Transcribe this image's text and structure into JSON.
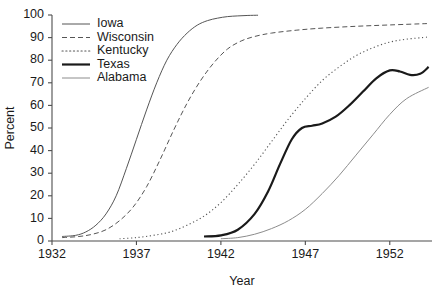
{
  "chart_data": {
    "type": "line",
    "title": "",
    "xlabel": "Year",
    "ylabel": "Percent",
    "xlim": [
      1932,
      1954.5
    ],
    "ylim": [
      0,
      100
    ],
    "grid": false,
    "legend_position": "top-left-inside",
    "xticks": [
      1932,
      1937,
      1942,
      1947,
      1952
    ],
    "xtick_labels": [
      "1932",
      "1937",
      "1942",
      "1947",
      "1952"
    ],
    "yticks": [
      0,
      10,
      20,
      30,
      40,
      50,
      60,
      70,
      80,
      90,
      100
    ],
    "ytick_labels": [
      "0",
      "10",
      "20",
      "30",
      "40",
      "50",
      "60",
      "70",
      "80",
      "90",
      "100"
    ],
    "series": [
      {
        "name": "Iowa",
        "style": "solid",
        "color": "#555555",
        "width": 1.0,
        "x": [
          1932.6,
          1933.4,
          1934.0,
          1934.6,
          1935.2,
          1935.8,
          1936.4,
          1937.0,
          1937.6,
          1938.2,
          1938.8,
          1939.4,
          1940.0,
          1940.6,
          1941.2,
          1941.8,
          1942.4,
          1943.0,
          1943.6,
          1944.2
        ],
        "y": [
          2,
          2.5,
          4,
          7,
          12,
          20,
          32,
          45,
          58,
          70,
          80,
          87,
          92,
          95.5,
          97.5,
          98.6,
          99.3,
          99.6,
          99.8,
          99.9
        ]
      },
      {
        "name": "Wisconsin",
        "style": "dashed",
        "color": "#555555",
        "width": 1.0,
        "x": [
          1932.6,
          1933.6,
          1934.4,
          1935.2,
          1936.0,
          1936.8,
          1937.6,
          1938.4,
          1939.2,
          1940.0,
          1940.8,
          1941.6,
          1942.4,
          1943.2,
          1944.0,
          1945.0,
          1946.5,
          1948.0,
          1950.0,
          1952.0,
          1954.2
        ],
        "y": [
          1.5,
          2,
          3,
          5,
          9,
          15,
          24,
          36,
          49,
          61,
          71,
          79,
          85,
          88.5,
          90.5,
          92,
          93.3,
          94.2,
          95.0,
          95.6,
          96.2
        ]
      },
      {
        "name": "Kentucky",
        "style": "dotted",
        "color": "#555555",
        "width": 1.1,
        "x": [
          1936.0,
          1937.0,
          1938.0,
          1939.0,
          1940.0,
          1941.0,
          1942.0,
          1943.0,
          1944.0,
          1945.0,
          1946.0,
          1947.0,
          1948.0,
          1949.0,
          1950.0,
          1951.0,
          1952.0,
          1953.0,
          1954.2
        ],
        "y": [
          1,
          1.5,
          2.5,
          4,
          7,
          11,
          17,
          25,
          34,
          44,
          54,
          63,
          71,
          77,
          82,
          85.5,
          88,
          89.3,
          90.2
        ]
      },
      {
        "name": "Texas",
        "style": "solid",
        "color": "#1a1a1a",
        "width": 2.2,
        "x": [
          1941.0,
          1942.0,
          1943.0,
          1944.0,
          1944.8,
          1945.5,
          1946.2,
          1946.8,
          1947.4,
          1948.0,
          1948.8,
          1949.6,
          1950.4,
          1951.2,
          1952.0,
          1952.6,
          1953.2,
          1953.8,
          1954.3
        ],
        "y": [
          2,
          2.5,
          5,
          12,
          22,
          34,
          45,
          50,
          51,
          52,
          55,
          60,
          66,
          72,
          75.5,
          75,
          73.5,
          74,
          77
        ]
      },
      {
        "name": "Alabama",
        "style": "solid",
        "color": "#8c8c8c",
        "width": 1.0,
        "x": [
          1942.0,
          1943.0,
          1944.0,
          1945.0,
          1946.0,
          1947.0,
          1948.0,
          1949.0,
          1950.0,
          1951.0,
          1952.0,
          1953.0,
          1954.3
        ],
        "y": [
          1,
          1.5,
          3,
          5.5,
          9,
          14,
          21,
          29,
          38,
          47,
          56,
          63,
          68
        ]
      }
    ]
  },
  "legend": {
    "items": [
      {
        "label": "Iowa"
      },
      {
        "label": "Wisconsin"
      },
      {
        "label": "Kentucky"
      },
      {
        "label": "Texas"
      },
      {
        "label": "Alabama"
      }
    ]
  }
}
